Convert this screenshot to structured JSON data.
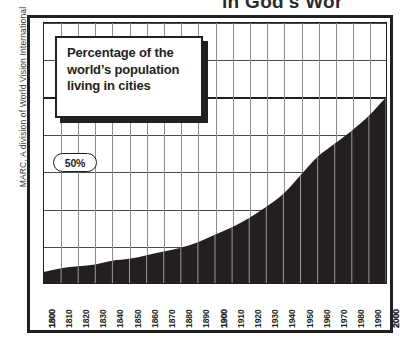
{
  "headline": {
    "text": "in God's Wor",
    "note": "cropped top headline fragment"
  },
  "credit": {
    "text": "MARC, A division of World Vision International"
  },
  "callout": {
    "line1": "Percentage of the",
    "line2": "world’s population",
    "line3": "living in cities"
  },
  "axis_label": {
    "fifty_percent": "50%"
  },
  "colors": {
    "ink": "#231f20",
    "area_fill": "#231f20",
    "grid": "#4a4a4a",
    "vgrid": "#8e8e8e",
    "paper": "#ffffff"
  },
  "chart_data": {
    "type": "area",
    "title": "Percentage of the world’s population living in cities",
    "xlabel": "",
    "ylabel": "",
    "xlim": [
      1800,
      2000
    ],
    "ylim": [
      0,
      70
    ],
    "grid": true,
    "legend": false,
    "annotations": [
      {
        "text": "50%",
        "y": 50,
        "style": "rounded-pill-on-gridline"
      }
    ],
    "gridlines_y": [
      10,
      20,
      30,
      40,
      50,
      60,
      70
    ],
    "major_gridline_y": 50,
    "x": [
      1800,
      1810,
      1820,
      1830,
      1840,
      1850,
      1860,
      1870,
      1880,
      1890,
      1900,
      1910,
      1920,
      1930,
      1940,
      1950,
      1960,
      1970,
      1980,
      1990,
      2000
    ],
    "values": [
      3,
      4,
      4.5,
      5,
      6,
      6.5,
      7.5,
      8.5,
      9.5,
      11,
      13,
      15,
      17.5,
      20.5,
      24,
      29,
      34,
      37.5,
      41,
      45,
      50
    ],
    "categories": [
      "1800",
      "1810",
      "1820",
      "1830",
      "1840",
      "1850",
      "1860",
      "1870",
      "1880",
      "1890",
      "1900",
      "1910",
      "1920",
      "1930",
      "1940",
      "1950",
      "1960",
      "1970",
      "1980",
      "1990",
      "2000"
    ],
    "emphasized_ticks": [
      "1800",
      "1900",
      "2000"
    ]
  }
}
